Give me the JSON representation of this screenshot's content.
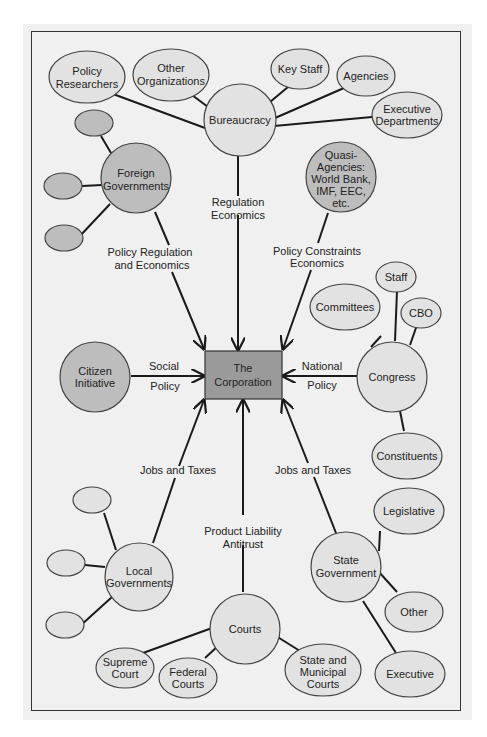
{
  "colors": {
    "background": "#ffffff",
    "panel": "#f0f0f0",
    "frame_border": "#333333",
    "node_light": "#e2e2e2",
    "node_dark": "#bdbdbd",
    "corporation": "#9a9a9a",
    "edge": "#1a1a1a"
  },
  "center": {
    "label_lines": [
      "The",
      "Corporation"
    ]
  },
  "hubs": {
    "bureaucracy": {
      "label_lines": [
        "Bureaucracy"
      ],
      "edge_label": [
        "Regulation",
        "Economics"
      ]
    },
    "foreign": {
      "label_lines": [
        "Foreign",
        "Governments"
      ],
      "edge_label": [
        "Policy Regulation",
        "and Economics"
      ]
    },
    "quasi": {
      "label_lines": [
        "Quasi-",
        "Agencies:",
        "World Bank,",
        "IMF, EEC,",
        "etc."
      ],
      "edge_label": [
        "Policy Constraints",
        "Economics"
      ]
    },
    "citizen": {
      "label_lines": [
        "Citizen",
        "Initiative"
      ],
      "edge_label": [
        "Social",
        "Policy"
      ]
    },
    "congress": {
      "label_lines": [
        "Congress"
      ],
      "edge_label": [
        "National",
        "Policy"
      ]
    },
    "local": {
      "label_lines": [
        "Local",
        "Governments"
      ],
      "edge_label": [
        "Jobs and Taxes"
      ]
    },
    "state": {
      "label_lines": [
        "State",
        "Government"
      ],
      "edge_label": [
        "Jobs and Taxes"
      ]
    },
    "courts": {
      "label_lines": [
        "Courts"
      ],
      "edge_label": [
        "Product Liability",
        "Antitrust"
      ]
    }
  },
  "satellites": {
    "bureaucracy": [
      {
        "label_lines": [
          "Policy",
          "Researchers"
        ]
      },
      {
        "label_lines": [
          "Other",
          "Organizations"
        ]
      },
      {
        "label_lines": [
          "Key Staff"
        ]
      },
      {
        "label_lines": [
          "Agencies"
        ]
      },
      {
        "label_lines": [
          "Executive",
          "Departments"
        ]
      }
    ],
    "foreign": [
      {
        "label_lines": []
      },
      {
        "label_lines": []
      },
      {
        "label_lines": []
      }
    ],
    "congress": [
      {
        "label_lines": [
          "Committees"
        ]
      },
      {
        "label_lines": [
          "Staff"
        ]
      },
      {
        "label_lines": [
          "CBO"
        ]
      },
      {
        "label_lines": [
          "Constituents"
        ]
      }
    ],
    "local": [
      {
        "label_lines": []
      },
      {
        "label_lines": []
      },
      {
        "label_lines": []
      }
    ],
    "state": [
      {
        "label_lines": [
          "Legislative"
        ]
      },
      {
        "label_lines": [
          "Other"
        ]
      },
      {
        "label_lines": [
          "Executive"
        ]
      }
    ],
    "courts": [
      {
        "label_lines": [
          "Supreme",
          "Court"
        ]
      },
      {
        "label_lines": [
          "Federal",
          "Courts"
        ]
      },
      {
        "label_lines": [
          "State and",
          "Municipal",
          "Courts"
        ]
      }
    ]
  }
}
